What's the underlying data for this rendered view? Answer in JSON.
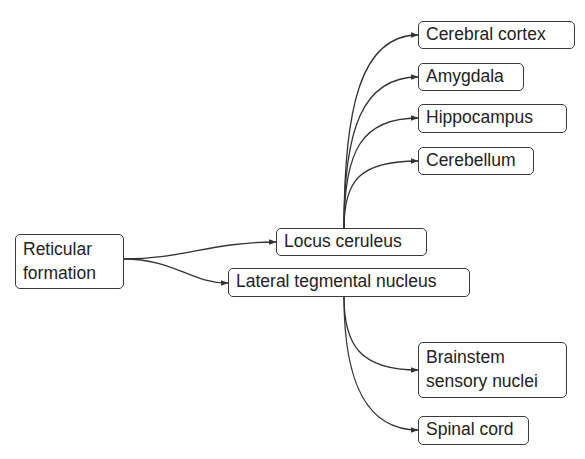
{
  "diagram": {
    "type": "flow",
    "source": {
      "label_line1": "Reticular",
      "label_line2": "formation"
    },
    "intermediate": [
      {
        "id": "lc",
        "label": "Locus ceruleus"
      },
      {
        "id": "ltn",
        "label": "Lateral tegmental nucleus"
      }
    ],
    "targets_lc": [
      {
        "label": "Cerebral cortex"
      },
      {
        "label": "Amygdala"
      },
      {
        "label": "Hippocampus"
      },
      {
        "label": "Cerebellum"
      }
    ],
    "targets_ltn": [
      {
        "label_line1": "Brainstem",
        "label_line2": "sensory nuclei"
      },
      {
        "label": "Spinal cord"
      }
    ],
    "edges": [
      [
        "Reticular formation",
        "Locus ceruleus"
      ],
      [
        "Reticular formation",
        "Lateral tegmental nucleus"
      ],
      [
        "Locus ceruleus",
        "Cerebral cortex"
      ],
      [
        "Locus ceruleus",
        "Amygdala"
      ],
      [
        "Locus ceruleus",
        "Hippocampus"
      ],
      [
        "Locus ceruleus",
        "Cerebellum"
      ],
      [
        "Lateral tegmental nucleus",
        "Brainstem sensory nuclei"
      ],
      [
        "Lateral tegmental nucleus",
        "Spinal cord"
      ]
    ],
    "colors": {
      "stroke": "#333333",
      "text": "#222222",
      "background": "#ffffff"
    }
  }
}
